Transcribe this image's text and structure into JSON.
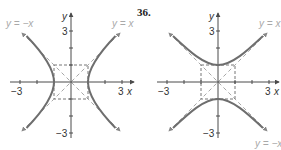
{
  "problem_number": "36.",
  "colors": {
    "axis": "#4a4a4a",
    "curve": "#6e6e6e",
    "asymptote": "#a8a8a8",
    "box": "#777777",
    "asymptote_label": "#a9a9a9"
  },
  "left_graph": {
    "description": "Hyperbola opening left/right with vertices at (±1, 0)",
    "axis_labels": {
      "x": "x",
      "y": "y"
    },
    "ticks": {
      "x_neg": "−3",
      "x_pos": "3",
      "y_pos": "3",
      "y_neg": "−3"
    },
    "asymptotes": {
      "neg": "y = −x",
      "pos": "y = x"
    }
  },
  "right_graph": {
    "description": "Hyperbola opening up/down with vertices at (0, ±1)",
    "axis_labels": {
      "x": "x",
      "y": "y"
    },
    "ticks": {
      "x_neg": "−3",
      "x_pos": "3",
      "y_pos": "3",
      "y_neg": "−3"
    },
    "asymptotes": {
      "pos": "y = x",
      "neg": "y = −x"
    }
  }
}
